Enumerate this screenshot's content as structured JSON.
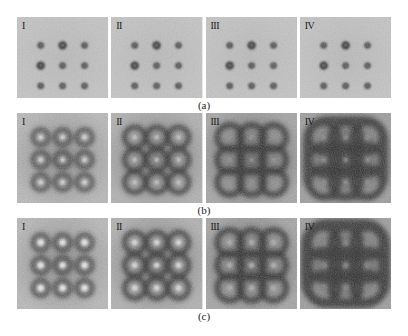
{
  "figure": {
    "rows": [
      {
        "id": "a",
        "caption": "(a)",
        "panels": [
          {
            "label": "I"
          },
          {
            "label": "II"
          },
          {
            "label": "III"
          },
          {
            "label": "IV"
          }
        ]
      },
      {
        "id": "b",
        "caption": "(b)",
        "panels": [
          {
            "label": "I"
          },
          {
            "label": "II"
          },
          {
            "label": "III"
          },
          {
            "label": "IV"
          }
        ]
      },
      {
        "id": "c",
        "caption": "(c)",
        "panels": [
          {
            "label": "I"
          },
          {
            "label": "II"
          },
          {
            "label": "III"
          },
          {
            "label": "IV"
          }
        ]
      }
    ]
  },
  "colors": {
    "background": "#ffffff",
    "panel_light": "#c8c8c8",
    "panel_mid": "#8a8a8a",
    "spot_dark": "#2a2a2a",
    "spot_core_light": "#e6e6e6"
  }
}
